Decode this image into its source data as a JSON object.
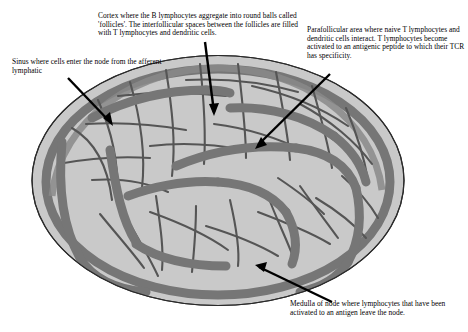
{
  "figure": {
    "background_color": "#ffffff",
    "node_fill_color": "#c9c9c9",
    "node_outline_color": "#2b2b2b",
    "sinus_band_color": "#767676",
    "trabecula_line_color": "#555555",
    "cortex_band_color": "#8a8a8a",
    "text_color": "#000000",
    "pointer_color": "#000000"
  },
  "annotations": {
    "cortex": {
      "name": "Cortex",
      "text": "Cortex where the B lymphocytes aggregate into round balls called 'follicles'. The interfollicular spaces between the follicles are filled with T lymphocytes and dendritic cells."
    },
    "sinus": {
      "name": "Sinus",
      "text": "Sinus where cells enter the node from the afferent lymphatic"
    },
    "parafollicular": {
      "name": "Parafollicular area",
      "text": "Parafollicular area where naive T lymphocytes and dendritic cells interact. T lymphocytes become activated to an antigenic peptide to which their TCR has specificity."
    },
    "medulla": {
      "name": "Medulla",
      "text": "Medulla of node where lymphocytes that have been activated to an antigen leave the node."
    }
  },
  "pointers": [
    {
      "name": "cortex-pointer",
      "from": [
        205,
        42
      ],
      "to": [
        214,
        112
      ]
    },
    {
      "name": "sinus-pointer",
      "from": [
        68,
        78
      ],
      "to": [
        110,
        122
      ]
    },
    {
      "name": "parafollicular-pointer",
      "from": [
        330,
        74
      ],
      "to": [
        258,
        145
      ]
    },
    {
      "name": "medulla-pointer",
      "from": [
        332,
        302
      ],
      "to": [
        259,
        267
      ]
    }
  ]
}
